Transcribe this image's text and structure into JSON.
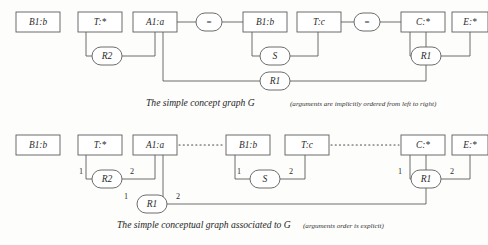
{
  "figure": {
    "colors": {
      "background": "#fdfdfc",
      "stroke": "#5c5c5c",
      "text": "#2b2b2b",
      "coref": "#4a4a4a"
    },
    "diagrams": [
      {
        "id": "top",
        "caption": "The simple concept graph G",
        "caption_note": "(arguments are implicitly ordered from left to right)",
        "concepts": [
          {
            "id": "t-b1b-left",
            "label": "B1:b",
            "x": 16,
            "y": 12,
            "w": 44,
            "h": 20
          },
          {
            "id": "t-tstar",
            "label": "T:*",
            "x": 78,
            "y": 12,
            "w": 44,
            "h": 20
          },
          {
            "id": "t-a1a",
            "label": "A1:a",
            "x": 133,
            "y": 12,
            "w": 44,
            "h": 20
          },
          {
            "id": "t-b1b-mid",
            "label": "B1:b",
            "x": 243,
            "y": 12,
            "w": 44,
            "h": 20
          },
          {
            "id": "t-tc",
            "label": "T:c",
            "x": 297,
            "y": 12,
            "w": 44,
            "h": 20
          },
          {
            "id": "t-cstar",
            "label": "C:*",
            "x": 401,
            "y": 12,
            "w": 44,
            "h": 20
          },
          {
            "id": "t-estar",
            "label": "E:*",
            "x": 452,
            "y": 12,
            "w": 36,
            "h": 20
          }
        ],
        "equality_nodes": [
          {
            "id": "t-eq-1",
            "label": "=",
            "cx": 209,
            "cy": 22
          },
          {
            "id": "t-eq-2",
            "label": "=",
            "cx": 367,
            "cy": 22
          }
        ],
        "relations": [
          {
            "id": "t-r2",
            "label": "R2",
            "cx": 107,
            "cy": 56
          },
          {
            "id": "t-s",
            "label": "S",
            "cx": 275,
            "cy": 56
          },
          {
            "id": "t-r1-right",
            "label": "R1",
            "cx": 426,
            "cy": 56
          },
          {
            "id": "t-r1-bottom",
            "label": "R1",
            "cx": 275,
            "cy": 81
          }
        ]
      },
      {
        "id": "bottom",
        "caption": "The simple conceptual graph associated to G",
        "caption_note": "(arguments order is explicit)",
        "concepts": [
          {
            "id": "b-b1b-left",
            "label": "B1:b",
            "x": 16,
            "y": 135,
            "w": 44,
            "h": 20
          },
          {
            "id": "b-tstar",
            "label": "T:*",
            "x": 78,
            "y": 135,
            "w": 44,
            "h": 20
          },
          {
            "id": "b-a1a",
            "label": "A1:a",
            "x": 133,
            "y": 135,
            "w": 44,
            "h": 20
          },
          {
            "id": "b-b1b-mid",
            "label": "B1:b",
            "x": 226,
            "y": 135,
            "w": 44,
            "h": 20
          },
          {
            "id": "b-tc",
            "label": "T:c",
            "x": 285,
            "y": 135,
            "w": 44,
            "h": 20
          },
          {
            "id": "b-cstar",
            "label": "C:*",
            "x": 401,
            "y": 135,
            "w": 44,
            "h": 20
          },
          {
            "id": "b-estar",
            "label": "E:*",
            "x": 452,
            "y": 135,
            "w": 36,
            "h": 20
          }
        ],
        "coreference_links": [
          {
            "id": "b-coref-1",
            "from": "b-a1a",
            "to": "b-b1b-mid",
            "x1": 179,
            "x2": 224,
            "y": 145
          },
          {
            "id": "b-coref-2",
            "from": "b-tc",
            "to": "b-cstar",
            "x1": 331,
            "x2": 399,
            "y": 145
          }
        ],
        "relations": [
          {
            "id": "b-r2",
            "label": "R2",
            "cx": 107,
            "cy": 179,
            "args": [
              "1",
              "2"
            ]
          },
          {
            "id": "b-s",
            "label": "S",
            "cx": 265,
            "cy": 179,
            "args": [
              "1",
              "2"
            ]
          },
          {
            "id": "b-r1-right",
            "label": "R1",
            "cx": 426,
            "cy": 179,
            "args": [
              "1",
              "2"
            ]
          },
          {
            "id": "b-r1-bottom",
            "label": "R1",
            "cx": 152,
            "cy": 204,
            "args": [
              "1",
              "2"
            ]
          }
        ]
      }
    ]
  }
}
